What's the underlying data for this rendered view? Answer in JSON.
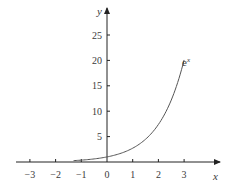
{
  "chart_data": {
    "type": "line",
    "title": "",
    "xlabel": "x",
    "ylabel": "y",
    "xlim": [
      -3.4,
      4.0
    ],
    "ylim": [
      0,
      30
    ],
    "x_ticks": [
      -3,
      -2,
      -1,
      0,
      1,
      2,
      3
    ],
    "x_tick_labels": [
      "−3",
      "−2",
      "−1",
      "0",
      "1",
      "2",
      "3"
    ],
    "y_ticks": [
      5,
      10,
      15,
      20,
      25
    ],
    "y_tick_labels": [
      "5",
      "10",
      "15",
      "20",
      "25"
    ],
    "grid": false,
    "legend": "none",
    "series": [
      {
        "name": "e^x",
        "label": "e",
        "label_superscript": "x",
        "function": "exp(x)",
        "x": [
          -3,
          -2.5,
          -2,
          -1.5,
          -1,
          -0.5,
          0,
          0.5,
          1,
          1.5,
          2,
          2.5,
          3
        ],
        "values": [
          0.05,
          0.08,
          0.14,
          0.22,
          0.37,
          0.61,
          1.0,
          1.65,
          2.72,
          4.48,
          7.39,
          12.18,
          20.09
        ],
        "color": "#555555"
      }
    ]
  }
}
